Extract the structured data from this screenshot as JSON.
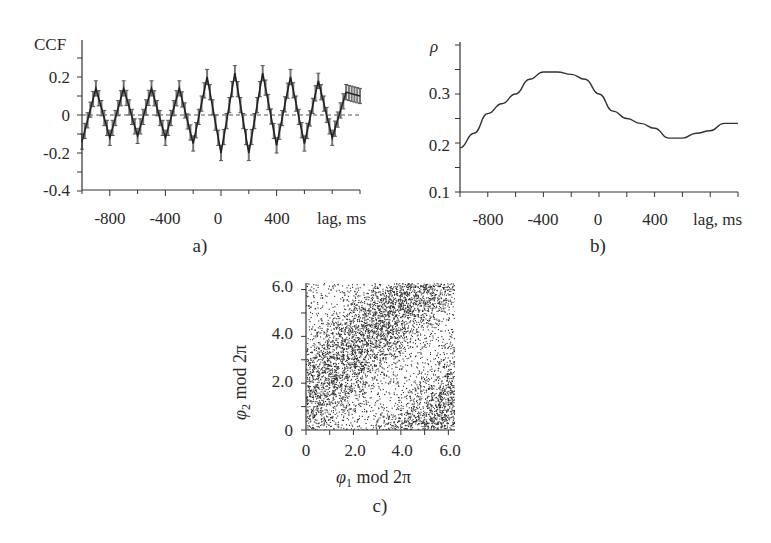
{
  "chart_data": [
    {
      "id": "a",
      "type": "line",
      "panel_label": "a)",
      "ylabel": "CCF",
      "xlabel": "lag, ms",
      "xlim": [
        -1000,
        1000
      ],
      "ylim": [
        -0.4,
        0.3
      ],
      "xticks": [
        -800,
        -400,
        0,
        400
      ],
      "xtick_labels": [
        "-800",
        "-400",
        "0",
        "400"
      ],
      "yticks": [
        0.2,
        0,
        -0.2,
        -0.4
      ],
      "ytick_labels": [
        "0.2",
        "0",
        "-0.2",
        "-0.4"
      ],
      "reference_line": {
        "y": 0,
        "style": "dashed"
      },
      "error_bars": true,
      "series": [
        {
          "name": "CCF",
          "x": [
            -1000,
            -900,
            -800,
            -700,
            -600,
            -500,
            -400,
            -300,
            -200,
            -100,
            0,
            100,
            200,
            300,
            400,
            500,
            600,
            700,
            800,
            900,
            1000
          ],
          "values": [
            -0.14,
            0.14,
            -0.12,
            0.14,
            -0.11,
            0.14,
            -0.12,
            0.14,
            -0.15,
            0.2,
            -0.2,
            0.22,
            -0.2,
            0.22,
            -0.16,
            0.2,
            -0.15,
            0.18,
            -0.12,
            0.12,
            0.1
          ]
        }
      ]
    },
    {
      "id": "b",
      "type": "line",
      "panel_label": "b)",
      "ylabel": "ρ",
      "xlabel": "lag, ms",
      "xlim": [
        -1000,
        1000
      ],
      "ylim": [
        0.1,
        0.4
      ],
      "xticks": [
        -800,
        -400,
        0,
        400
      ],
      "xtick_labels": [
        "-800",
        "-400",
        "0",
        "400"
      ],
      "yticks": [
        0.1,
        0.2,
        0.3
      ],
      "ytick_labels": [
        "0.1",
        "0.2",
        "0.3"
      ],
      "series": [
        {
          "name": "rho",
          "x": [
            -1000,
            -900,
            -800,
            -700,
            -600,
            -500,
            -400,
            -300,
            -200,
            -100,
            0,
            100,
            200,
            300,
            400,
            500,
            600,
            700,
            800,
            900,
            1000
          ],
          "values": [
            0.19,
            0.22,
            0.26,
            0.28,
            0.3,
            0.33,
            0.345,
            0.345,
            0.34,
            0.33,
            0.3,
            0.265,
            0.25,
            0.24,
            0.23,
            0.21,
            0.21,
            0.22,
            0.225,
            0.24,
            0.24
          ]
        }
      ]
    },
    {
      "id": "c",
      "type": "scatter",
      "panel_label": "c)",
      "xlabel": "φ1 mod 2π",
      "ylabel": "φ2 mod 2π",
      "xlim": [
        0,
        6.28
      ],
      "ylim": [
        0,
        6.28
      ],
      "xticks": [
        0,
        2.0,
        4.0,
        6.0
      ],
      "xtick_labels": [
        "0",
        "2.0",
        "4.0",
        "6.0"
      ],
      "yticks": [
        0,
        2.0,
        4.0,
        6.0
      ],
      "ytick_labels": [
        "0",
        "2.0",
        "4.0",
        "6.0"
      ],
      "description": "Dense scatter of phase pairs; points concentrate in diagonal bands (phi2 ≈ phi1 + ~1.5 mod 2π), with sparser light bands in between"
    }
  ],
  "panels": {
    "a": {
      "label": "a)",
      "ylabel": "CCF",
      "xlabel": "lag, ms",
      "yticks": [
        "0.2",
        "0",
        "-0.2",
        "-0.4"
      ],
      "xticks": [
        "-800",
        "-400",
        "0",
        "400"
      ]
    },
    "b": {
      "label": "b)",
      "ylabel": "ρ",
      "xlabel": "lag, ms",
      "yticks": [
        "0.3",
        "0.2",
        "0.1"
      ],
      "xticks": [
        "-800",
        "-400",
        "0",
        "400"
      ]
    },
    "c": {
      "label": "c)",
      "xlabel_sym": "φ",
      "xlabel_sub": "1",
      "xlabel_rest": " mod 2π",
      "ylabel_sym": "φ",
      "ylabel_sub": "2",
      "ylabel_rest": " mod 2π",
      "xticks": [
        "0",
        "2.0",
        "4.0",
        "6.0"
      ],
      "yticks": [
        "6.0",
        "4.0",
        "2.0",
        "0"
      ]
    }
  }
}
